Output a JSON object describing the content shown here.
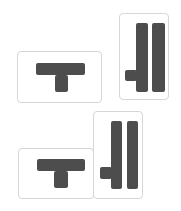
{
  "colors": {
    "shape": "#4d4d4d",
    "card_border": "#d6d6d6",
    "card_bg": "#ffffff"
  },
  "groups": [
    {
      "name": "separated-pair",
      "cards": [
        {
          "name": "t-piece-card",
          "icon": "t-shape-icon",
          "box": [
            17,
            51,
            85,
            52
          ],
          "parts": [
            [
              18,
              11,
              49,
              12
            ],
            [
              37,
              23,
              13,
              17
            ]
          ]
        },
        {
          "name": "double-bar-piece-card",
          "icon": "double-bar-notch-icon",
          "box": [
            119,
            13,
            50,
            87
          ],
          "parts": [
            [
              16,
              9,
              12,
              69
            ],
            [
              32,
              9,
              13,
              69
            ],
            [
              5,
              56,
              12,
              11
            ]
          ]
        }
      ]
    },
    {
      "name": "joined-pair",
      "cards": [
        {
          "name": "t-piece-card",
          "icon": "t-shape-icon",
          "box": [
            18,
            148,
            76,
            51
          ],
          "parts": [
            [
              18,
              10,
              48,
              12
            ],
            [
              35,
              22,
              14,
              17
            ]
          ]
        },
        {
          "name": "double-bar-piece-card",
          "icon": "double-bar-notch-icon",
          "box": [
            93,
            111,
            50,
            88
          ],
          "parts": [
            [
              17,
              9,
              11,
              68
            ],
            [
              33,
              9,
              11,
              68
            ],
            [
              6,
              55,
              12,
              12
            ]
          ]
        }
      ]
    }
  ]
}
